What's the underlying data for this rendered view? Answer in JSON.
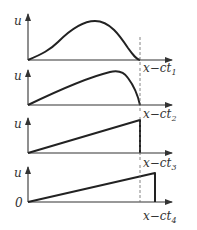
{
  "diagram": {
    "panels": [
      {
        "id": 1,
        "y_label": "u",
        "x_label_main": "x−ct",
        "x_label_sub": "1",
        "shape": "smooth hump"
      },
      {
        "id": 2,
        "y_label": "u",
        "x_label_main": "x−ct",
        "x_label_sub": "2",
        "shape": "skewed hump, steep front"
      },
      {
        "id": 3,
        "y_label": "u",
        "x_label_main": "x−ct",
        "x_label_sub": "3",
        "shape": "linear ramp with vertical shock"
      },
      {
        "id": 4,
        "y_label": "u",
        "x_label_main": "x−ct",
        "x_label_sub": "4",
        "shape": "linear ramp, shock moved beyond dashed line",
        "origin_label": "0"
      }
    ],
    "colors": {
      "line": "#222222",
      "axis": "#333333",
      "dashed": "#666666"
    }
  }
}
